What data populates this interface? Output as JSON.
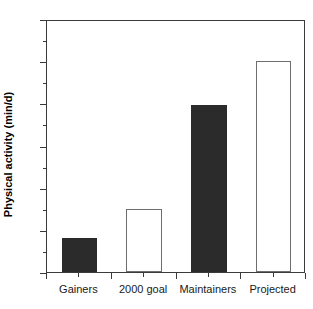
{
  "chart_data": {
    "type": "bar",
    "title": "",
    "subtitle": "",
    "xlabel": "",
    "ylabel": "Physical activity (min/d)",
    "categories": [
      "Gainers",
      "2000 goal",
      "Maintainers",
      "Projected"
    ],
    "values": [
      16,
      30,
      79,
      100
    ],
    "series": [
      {
        "name": "Physical activity",
        "values": [
          16,
          30,
          79,
          100
        ]
      }
    ],
    "bar_styles": [
      "filled",
      "open",
      "filled",
      "open"
    ],
    "bar_colors": [
      "#2b2b2b",
      "#ffffff",
      "#2b2b2b",
      "#ffffff"
    ],
    "bar_edge_colors": [
      "#2b2b2b",
      "#6e6e6e",
      "#2b2b2b",
      "#6e6e6e"
    ],
    "ylim": [
      0,
      120
    ],
    "xlim": [
      0,
      4
    ],
    "ytick_values": [
      0,
      20,
      40,
      60,
      80,
      100,
      120
    ],
    "ytick_labels": [
      "0",
      "20",
      "40",
      "60",
      "80",
      "100",
      "120"
    ],
    "yminor_tick_values": [
      10,
      30,
      50,
      70,
      90,
      110
    ],
    "ytick_interval": 20,
    "grid": false,
    "legend": null,
    "legend_position": "none",
    "annotations": [],
    "background_color": "#ffffff",
    "axis_color": "#3a3a3a",
    "text_color": "#1a1a1a"
  },
  "figure": {
    "plot_left_px": 46,
    "plot_top_px": 20,
    "plot_width_px": 259,
    "plot_height_px": 253
  }
}
